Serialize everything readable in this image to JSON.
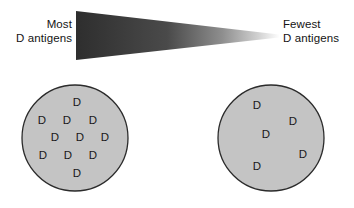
{
  "diagram": {
    "title_present": false,
    "colors": {
      "gradient_dark": "#2e2e2e",
      "gradient_light": "#fdfdfd",
      "cell_fill": "#c4c4c4",
      "cell_stroke": "#2b2b2b",
      "text": "#1a1a1a",
      "background": "#ffffff"
    },
    "gradient_wedge": {
      "name": "d-antigen-density-gradient",
      "orientation": "left-to-right",
      "meaning": "antigen density decreases from left to right"
    },
    "labels": {
      "left": {
        "line1": "Most",
        "line2": "D antigens"
      },
      "right": {
        "line1": "Fewest",
        "line2": "D antigens"
      }
    },
    "cells": [
      {
        "name": "red-blood-cell-most-antigens",
        "position": "left",
        "antigen_label": "D",
        "antigen_count": 11,
        "antigens": [
          {
            "x": 59,
            "y": 22
          },
          {
            "x": 24,
            "y": 40
          },
          {
            "x": 49,
            "y": 40
          },
          {
            "x": 75,
            "y": 40
          },
          {
            "x": 37,
            "y": 57
          },
          {
            "x": 62,
            "y": 57
          },
          {
            "x": 87,
            "y": 57
          },
          {
            "x": 25,
            "y": 75
          },
          {
            "x": 50,
            "y": 75
          },
          {
            "x": 75,
            "y": 75
          },
          {
            "x": 59,
            "y": 93
          }
        ]
      },
      {
        "name": "red-blood-cell-fewest-antigens",
        "position": "right",
        "antigen_label": "D",
        "antigen_count": 5,
        "antigens": [
          {
            "x": 43,
            "y": 25
          },
          {
            "x": 79,
            "y": 41
          },
          {
            "x": 52,
            "y": 54
          },
          {
            "x": 89,
            "y": 74
          },
          {
            "x": 43,
            "y": 86
          }
        ]
      }
    ]
  }
}
